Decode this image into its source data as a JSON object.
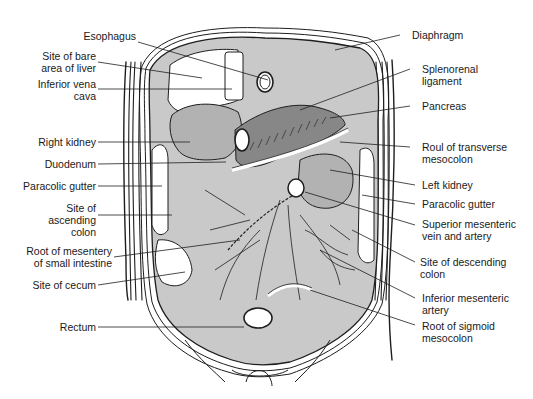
{
  "figure": {
    "colors": {
      "outline": "#1e1e1e",
      "light_fill": "#c9c9c9",
      "mid_fill": "#b2b2b2",
      "dark_fill": "#878787",
      "background": "#ffffff"
    }
  },
  "labels_left": [
    {
      "id": "site-of-bare-area-of-liver",
      "text": "Site of bare\narea of liver"
    },
    {
      "id": "inferior-vena-cava",
      "text": "Inferior vena\ncava"
    },
    {
      "id": "right-kidney",
      "text": "Right kidney"
    },
    {
      "id": "duodenum",
      "text": "Duodenum"
    },
    {
      "id": "paracolic-gutter-right",
      "text": "Paracolic gutter"
    },
    {
      "id": "site-of-ascending-colon",
      "text": "Site of\nascending\ncolon"
    },
    {
      "id": "root-of-mesentery",
      "text": "Root of mesentery\nof small intestine"
    },
    {
      "id": "site-of-cecum",
      "text": "Site of cecum"
    },
    {
      "id": "rectum",
      "text": "Rectum"
    }
  ],
  "labels_top": [
    {
      "id": "esophagus",
      "text": "Esophagus"
    }
  ],
  "labels_right": [
    {
      "id": "diaphragm",
      "text": "Diaphragm"
    },
    {
      "id": "splenorenal-ligament",
      "text": "Splenorenal\nligament"
    },
    {
      "id": "pancreas",
      "text": "Pancreas"
    },
    {
      "id": "root-of-transverse-mesocolon",
      "text": "Roul of transverse\nmesocolon"
    },
    {
      "id": "left-kidney",
      "text": "Left kidney"
    },
    {
      "id": "paracolic-gutter-left",
      "text": "Paracolic gutter"
    },
    {
      "id": "superior-mesenteric-vein-artery",
      "text": "Superior mesenteric\nvein and artery"
    },
    {
      "id": "site-of-descending-colon",
      "text": "Site of descending\ncolon"
    },
    {
      "id": "inferior-mesenteric-artery",
      "text": "Inferior mesenteric\nartery"
    },
    {
      "id": "root-of-sigmoid-mesocolon",
      "text": "Root of sigmoid\nmesocolon"
    }
  ]
}
